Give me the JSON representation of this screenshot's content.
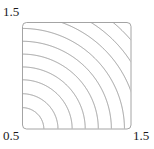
{
  "figure": {
    "name": "contour-plot",
    "background_color": "#ffffff"
  },
  "labels": {
    "top_left": "1.5",
    "bottom_left": "0.5",
    "bottom_right": "1.5"
  },
  "chart_data": {
    "type": "line",
    "plot_kind": "contour",
    "title": "",
    "xlabel": "",
    "ylabel": "",
    "xlim": [
      0.5,
      1.5
    ],
    "ylim": [
      0.5,
      1.5
    ],
    "xticks": [
      0.5,
      1.5
    ],
    "yticks": [
      0.5,
      1.5
    ],
    "xtick_labels": [
      "0.5",
      "1.5"
    ],
    "ytick_labels": [
      "0.5",
      "1.5"
    ],
    "grid": false,
    "legend": false,
    "axis_labels_at_corners": true,
    "frame": {
      "visible": true,
      "rounded_corners": true,
      "color": "#9a9a9a"
    },
    "contour": {
      "line_color": "#8c8c8c",
      "line_width": 0.85,
      "filled": false,
      "n_levels": 11,
      "description": "Nested arc-like contours curving around the lower-left corner; levels increase toward the upper-right corner.",
      "levels": [
        0.3,
        0.4,
        0.5,
        0.6,
        0.7,
        0.8,
        0.9,
        1.0,
        1.1,
        1.2,
        1.3
      ],
      "level_radii_normalized": [
        0.2,
        0.33,
        0.46,
        0.58,
        0.7,
        0.82,
        0.94,
        1.06,
        1.18,
        1.3,
        1.42
      ],
      "center_normalized": [
        0.0,
        0.0
      ],
      "curves": [
        {
          "level": 0.3,
          "r": 0.2
        },
        {
          "level": 0.4,
          "r": 0.33
        },
        {
          "level": 0.5,
          "r": 0.46
        },
        {
          "level": 0.6,
          "r": 0.58
        },
        {
          "level": 0.7,
          "r": 0.7
        },
        {
          "level": 0.8,
          "r": 0.82
        },
        {
          "level": 0.9,
          "r": 0.94
        },
        {
          "level": 1.0,
          "r": 1.06
        },
        {
          "level": 1.1,
          "r": 1.18
        },
        {
          "level": 1.2,
          "r": 1.3
        },
        {
          "level": 1.3,
          "r": 1.42
        }
      ]
    },
    "plot_area_px": {
      "x": 22,
      "y": 22,
      "width": 109,
      "height": 107
    }
  }
}
